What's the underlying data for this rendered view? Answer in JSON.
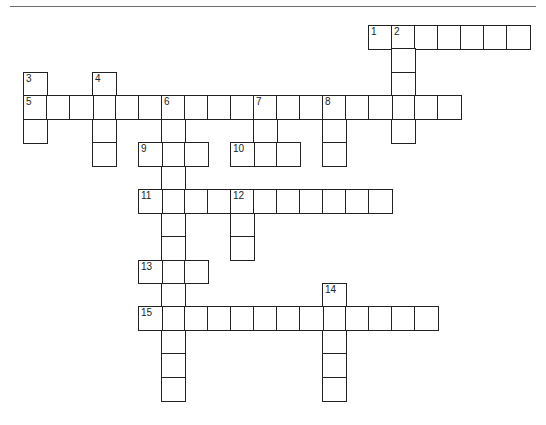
{
  "puzzle": {
    "type": "crossword",
    "layout": {
      "origin_x": 23,
      "origin_y": 25,
      "cell_w": 23,
      "cell_h": 23.45
    },
    "colors": {
      "line": "#222222",
      "separator": "#6e6e6e",
      "background": "#ffffff"
    },
    "entries": [
      {
        "number": 1,
        "direction": "across",
        "row": 0,
        "col": 15,
        "length": 7
      },
      {
        "number": 2,
        "direction": "down",
        "row": 0,
        "col": 16,
        "length": 5
      },
      {
        "number": 3,
        "direction": "down",
        "row": 2,
        "col": 0,
        "length": 3
      },
      {
        "number": 4,
        "direction": "down",
        "row": 2,
        "col": 3,
        "length": 4
      },
      {
        "number": 5,
        "direction": "across",
        "row": 3,
        "col": 0,
        "length": 19
      },
      {
        "number": 6,
        "direction": "down",
        "row": 3,
        "col": 6,
        "length": 13
      },
      {
        "number": 7,
        "direction": "down",
        "row": 3,
        "col": 10,
        "length": 3
      },
      {
        "number": 8,
        "direction": "down",
        "row": 3,
        "col": 13,
        "length": 3
      },
      {
        "number": 9,
        "direction": "across",
        "row": 5,
        "col": 5,
        "length": 3
      },
      {
        "number": 10,
        "direction": "across",
        "row": 5,
        "col": 9,
        "length": 3
      },
      {
        "number": 11,
        "direction": "across",
        "row": 7,
        "col": 5,
        "length": 11
      },
      {
        "number": 12,
        "direction": "down",
        "row": 7,
        "col": 9,
        "length": 3
      },
      {
        "number": 13,
        "direction": "across",
        "row": 10,
        "col": 5,
        "length": 3
      },
      {
        "number": 14,
        "direction": "down",
        "row": 11,
        "col": 13,
        "length": 5
      },
      {
        "number": 15,
        "direction": "across",
        "row": 12,
        "col": 5,
        "length": 13
      }
    ]
  }
}
